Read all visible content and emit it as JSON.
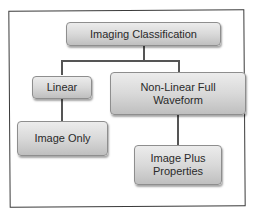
{
  "diagram": {
    "type": "hierarchy",
    "root": {
      "label": "Imaging Classification"
    },
    "nodes": [
      {
        "id": "linear",
        "label": "Linear",
        "parent": "root"
      },
      {
        "id": "nonlinear",
        "label": "Non-Linear Full Waveform",
        "parent": "root"
      },
      {
        "id": "image_only",
        "label": "Image Only",
        "parent": "linear"
      },
      {
        "id": "image_plus",
        "label": "Image Plus Properties",
        "parent": "nonlinear"
      }
    ],
    "colors": {
      "node_fill": "#d9d9d9",
      "node_border": "#8e8e8e",
      "connector": "#555555",
      "frame": "#3a3a3a"
    }
  }
}
